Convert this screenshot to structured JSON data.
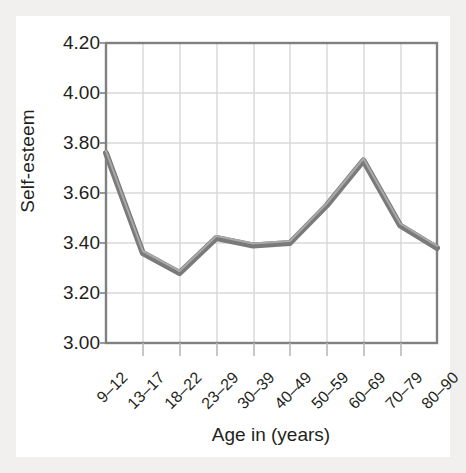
{
  "chart_data": {
    "type": "line",
    "title": "",
    "xlabel": "Age in (years)",
    "ylabel": "Self-esteem",
    "categories": [
      "9–12",
      "13–17",
      "18–22",
      "23–29",
      "30–39",
      "40–49",
      "50–59",
      "60–69",
      "70–79",
      "80–90"
    ],
    "values": [
      3.76,
      3.36,
      3.28,
      3.42,
      3.39,
      3.4,
      3.55,
      3.73,
      3.47,
      3.38
    ],
    "series": [
      {
        "name": "Self-esteem",
        "values": [
          3.76,
          3.36,
          3.28,
          3.42,
          3.39,
          3.4,
          3.55,
          3.73,
          3.47,
          3.38
        ]
      }
    ],
    "ylim": [
      3.0,
      4.2
    ],
    "ytick_labels": [
      "4.20",
      "4.00",
      "3.80",
      "3.60",
      "3.40",
      "3.20",
      "3.00"
    ],
    "ytick_values": [
      4.2,
      4.0,
      3.8,
      3.6,
      3.4,
      3.2,
      3.0
    ],
    "grid": true,
    "legend": "none",
    "line_color": "#7a7a7a",
    "grid_color": "#d8d8d8",
    "axis_color": "#808080",
    "text_color": "#231f20",
    "plot_background": "#ffffff",
    "page_background": "#f1f0ef"
  }
}
